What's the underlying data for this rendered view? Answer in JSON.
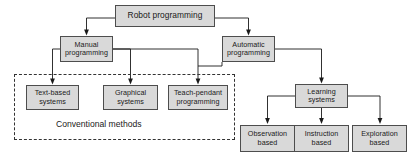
{
  "diagram": {
    "colors": {
      "node_fill": "#d9d9d9",
      "node_border": "#4d4d4d",
      "connector": "#1a1a1a",
      "dashed_group_border": "#333333",
      "background": "#ffffff",
      "text": "#1a1a1a"
    },
    "nodes": {
      "root": {
        "label": "Robot programming"
      },
      "manual": {
        "label": "Manual\nprogramming"
      },
      "automatic": {
        "label": "Automatic\nprogramming"
      },
      "text_based": {
        "label": "Text-based\nsystems"
      },
      "graphical": {
        "label": "Graphical\nsystems"
      },
      "teach_pendant": {
        "label": "Teach-pendant\nprogramming"
      },
      "learning": {
        "label": "Learning\nsystems"
      },
      "observation": {
        "label": "Observation\nbased"
      },
      "instruction": {
        "label": "Instruction\nbased"
      },
      "exploration": {
        "label": "Exploration\nbased"
      }
    },
    "groups": {
      "conventional": {
        "label": "Conventional methods"
      }
    }
  }
}
